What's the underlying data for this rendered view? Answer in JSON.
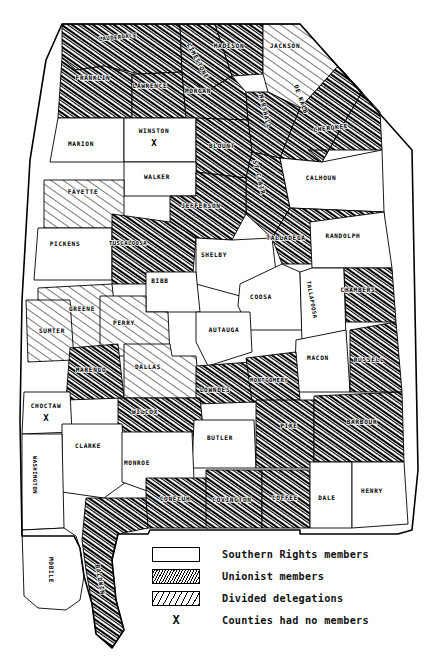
{
  "map": {
    "state": "Alabama",
    "legend": {
      "items": [
        {
          "key": "southern_rights",
          "pattern": "white",
          "label": "Southern Rights members"
        },
        {
          "key": "unionist",
          "pattern": "dense-hatch",
          "label": "Unionist members"
        },
        {
          "key": "divided",
          "pattern": "sparse-hatch",
          "label": "Divided delegations"
        },
        {
          "key": "no_members",
          "pattern": "x-mark",
          "label": "Counties had no members"
        }
      ]
    },
    "counties": [
      {
        "name": "LAUDERDALE",
        "category": "unionist",
        "lx": 118,
        "ly": 39,
        "rot": -6
      },
      {
        "name": "LIMESTONE",
        "category": "unionist",
        "lx": 196,
        "ly": 62,
        "rot": 62
      },
      {
        "name": "MADISON",
        "category": "unionist",
        "lx": 229,
        "ly": 48,
        "rot": 0
      },
      {
        "name": "JACKSON",
        "category": "divided",
        "lx": 285,
        "ly": 48,
        "rot": 0
      },
      {
        "name": "FRANKLIN",
        "category": "unionist",
        "lx": 93,
        "ly": 80,
        "rot": 0
      },
      {
        "name": "LAWRENCE",
        "category": "unionist",
        "lx": 150,
        "ly": 88,
        "rot": 0
      },
      {
        "name": "MORGAN",
        "category": "unionist",
        "lx": 198,
        "ly": 93,
        "rot": 0
      },
      {
        "name": "MARSHALL",
        "category": "unionist",
        "lx": 263,
        "ly": 112,
        "rot": 76
      },
      {
        "name": "DE KALB",
        "category": "unionist",
        "lx": 299,
        "ly": 100,
        "rot": 70
      },
      {
        "name": "CHEROKEE",
        "category": "unionist",
        "lx": 331,
        "ly": 130,
        "rot": -7
      },
      {
        "name": "MARION",
        "category": "southern_rights",
        "lx": 81,
        "ly": 146,
        "rot": 0
      },
      {
        "name": "WINSTON",
        "category": "no_members",
        "lx": 154,
        "ly": 133,
        "rot": 0
      },
      {
        "name": "BLOUNT",
        "category": "unionist",
        "lx": 222,
        "ly": 148,
        "rot": 0
      },
      {
        "name": "ST CLAIR",
        "category": "unionist",
        "lx": 257,
        "ly": 178,
        "rot": 76
      },
      {
        "name": "CALHOUN",
        "category": "southern_rights",
        "lx": 321,
        "ly": 180,
        "rot": 0
      },
      {
        "name": "WALKER",
        "category": "southern_rights",
        "lx": 157,
        "ly": 179,
        "rot": 0
      },
      {
        "name": "FAYETTE",
        "category": "divided",
        "lx": 83,
        "ly": 194,
        "rot": 0
      },
      {
        "name": "JEFFERSON",
        "category": "unionist",
        "lx": 201,
        "ly": 208,
        "rot": 0
      },
      {
        "name": "TALLADEGA",
        "category": "unionist",
        "lx": 286,
        "ly": 240,
        "rot": 0
      },
      {
        "name": "RANDOLPH",
        "category": "southern_rights",
        "lx": 343,
        "ly": 238,
        "rot": 0
      },
      {
        "name": "PICKENS",
        "category": "southern_rights",
        "lx": 65,
        "ly": 246,
        "rot": 0
      },
      {
        "name": "TUSCALOOSA",
        "category": "unionist",
        "lx": 128,
        "ly": 245,
        "rot": 0
      },
      {
        "name": "SHELBY",
        "category": "southern_rights",
        "lx": 214,
        "ly": 257,
        "rot": 0
      },
      {
        "name": "BIBB",
        "category": "southern_rights",
        "lx": 160,
        "ly": 283,
        "rot": 0
      },
      {
        "name": "COOSA",
        "category": "southern_rights",
        "lx": 261,
        "ly": 299,
        "rot": 0
      },
      {
        "name": "TALLAPOOSA",
        "category": "southern_rights",
        "lx": 310,
        "ly": 300,
        "rot": 80
      },
      {
        "name": "CHAMBERS",
        "category": "unionist",
        "lx": 358,
        "ly": 292,
        "rot": 0
      },
      {
        "name": "GREENE",
        "category": "divided",
        "lx": 82,
        "ly": 311,
        "rot": 0
      },
      {
        "name": "SUMTER",
        "category": "divided",
        "lx": 52,
        "ly": 333,
        "rot": 0
      },
      {
        "name": "PERRY",
        "category": "divided",
        "lx": 124,
        "ly": 325,
        "rot": 0
      },
      {
        "name": "AUTAUGA",
        "category": "southern_rights",
        "lx": 224,
        "ly": 332,
        "rot": 0
      },
      {
        "name": "MACON",
        "category": "southern_rights",
        "lx": 318,
        "ly": 360,
        "rot": 0
      },
      {
        "name": "RUSSELL",
        "category": "unionist",
        "lx": 369,
        "ly": 362,
        "rot": 0
      },
      {
        "name": "MARENGO",
        "category": "unionist",
        "lx": 91,
        "ly": 372,
        "rot": 0
      },
      {
        "name": "DALLAS",
        "category": "divided",
        "lx": 148,
        "ly": 369,
        "rot": 0
      },
      {
        "name": "MONTGOMERY",
        "category": "unionist",
        "lx": 269,
        "ly": 382,
        "rot": 0
      },
      {
        "name": "LOWNDES",
        "category": "unionist",
        "lx": 215,
        "ly": 392,
        "rot": 0
      },
      {
        "name": "CHOCTAW",
        "category": "no_members",
        "lx": 46,
        "ly": 408,
        "rot": 0
      },
      {
        "name": "WILCOX",
        "category": "unionist",
        "lx": 145,
        "ly": 414,
        "rot": 0
      },
      {
        "name": "BARBOUR",
        "category": "unionist",
        "lx": 362,
        "ly": 424,
        "rot": 0
      },
      {
        "name": "BUTLER",
        "category": "southern_rights",
        "lx": 220,
        "ly": 440,
        "rot": 0
      },
      {
        "name": "PIKE",
        "category": "unionist",
        "lx": 289,
        "ly": 428,
        "rot": 0
      },
      {
        "name": "CLARKE",
        "category": "southern_rights",
        "lx": 88,
        "ly": 448,
        "rot": 0
      },
      {
        "name": "MONROE",
        "category": "southern_rights",
        "lx": 137,
        "ly": 465,
        "rot": 0
      },
      {
        "name": "WASHINGTON",
        "category": "southern_rights",
        "lx": 33,
        "ly": 475,
        "rot": 90
      },
      {
        "name": "CONECUH",
        "category": "unionist",
        "lx": 175,
        "ly": 501,
        "rot": 0
      },
      {
        "name": "COVINGTON",
        "category": "unionist",
        "lx": 232,
        "ly": 502,
        "rot": 0
      },
      {
        "name": "COFFEE",
        "category": "unionist",
        "lx": 285,
        "ly": 500,
        "rot": 0
      },
      {
        "name": "DALE",
        "category": "southern_rights",
        "lx": 327,
        "ly": 500,
        "rot": 0
      },
      {
        "name": "HENRY",
        "category": "southern_rights",
        "lx": 372,
        "ly": 493,
        "rot": 0
      },
      {
        "name": "MOBILE",
        "category": "southern_rights",
        "lx": 49,
        "ly": 570,
        "rot": 90
      },
      {
        "name": "BALDWIN",
        "category": "unionist",
        "lx": 98,
        "ly": 580,
        "rot": 80
      }
    ]
  }
}
